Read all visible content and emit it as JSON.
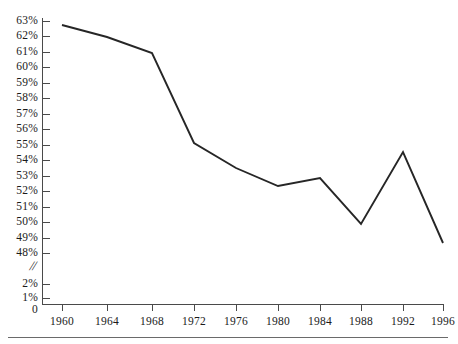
{
  "chart_data": {
    "type": "line",
    "title": "",
    "subtitle": "",
    "xlabel": "",
    "ylabel": "",
    "x": [
      1960,
      1964,
      1968,
      1972,
      1976,
      1980,
      1984,
      1988,
      1992,
      1996
    ],
    "categories": [
      "1960",
      "1964",
      "1968",
      "1972",
      "1976",
      "1980",
      "1984",
      "1988",
      "1992",
      "1996"
    ],
    "values": [
      62.7,
      61.9,
      60.9,
      54.7,
      53.0,
      52.4,
      52.8,
      49.8,
      54.6,
      48.7
    ],
    "series": [
      {
        "name": "",
        "values": [
          62.7,
          61.9,
          60.9,
          54.7,
          53.0,
          52.4,
          52.8,
          49.8,
          54.6,
          48.7
        ]
      }
    ],
    "xlim": [
      1960,
      1996
    ],
    "ylim": [
      48,
      63
    ],
    "grid": false,
    "legend": false,
    "legend_position": "none",
    "axis_break": true,
    "axis_break_symbol": "//",
    "line_color": "#262626",
    "y_tick_labels_main": [
      "63%",
      "62%",
      "61%",
      "60%",
      "59%",
      "58%",
      "57%",
      "56%",
      "55%",
      "54%",
      "53%",
      "52%",
      "51%",
      "50%",
      "49%",
      "48%"
    ],
    "y_tick_values_main": [
      63,
      62,
      61,
      60,
      59,
      58,
      57,
      56,
      55,
      54,
      53,
      52,
      51,
      50,
      49,
      48
    ],
    "y_tick_labels_lower": [
      "2%",
      "1%",
      "0"
    ],
    "y_tick_values_lower": [
      2,
      1,
      0
    ],
    "x_tick_labels": [
      "1960",
      "1964",
      "1968",
      "1972",
      "1976",
      "1980",
      "1984",
      "1988",
      "1992",
      "1996"
    ],
    "annotations": []
  },
  "axes": {
    "y_ticks": [
      {
        "label": "63%",
        "y": 21
      },
      {
        "label": "62%",
        "y": 36
      },
      {
        "label": "61%",
        "y": 52
      },
      {
        "label": "60%",
        "y": 67
      },
      {
        "label": "59%",
        "y": 83
      },
      {
        "label": "58%",
        "y": 98
      },
      {
        "label": "57%",
        "y": 114
      },
      {
        "label": "56%",
        "y": 129
      },
      {
        "label": "55%",
        "y": 145
      },
      {
        "label": "54%",
        "y": 160
      },
      {
        "label": "53%",
        "y": 176
      },
      {
        "label": "52%",
        "y": 191
      },
      {
        "label": "51%",
        "y": 207
      },
      {
        "label": "50%",
        "y": 222
      },
      {
        "label": "49%",
        "y": 238
      },
      {
        "label": "48%",
        "y": 253
      }
    ],
    "y_ticks_lower": [
      {
        "label": "2%",
        "y": 284
      },
      {
        "label": "1%",
        "y": 298
      },
      {
        "label": "0",
        "y": 310
      }
    ],
    "x_ticks": [
      {
        "label": "1960",
        "x": 62
      },
      {
        "label": "1964",
        "x": 107
      },
      {
        "label": "1968",
        "x": 152
      },
      {
        "label": "1972",
        "x": 194
      },
      {
        "label": "1976",
        "x": 236
      },
      {
        "label": "1980",
        "x": 278
      },
      {
        "label": "1984",
        "x": 320
      },
      {
        "label": "1988",
        "x": 361
      },
      {
        "label": "1992",
        "x": 403
      },
      {
        "label": "1996",
        "x": 443
      }
    ],
    "break_symbol": "//"
  },
  "polyline": {
    "points": "62,25 107,37 152,53 194,143 236,168 278,186 320,178 361,224 403,152 443,243"
  }
}
